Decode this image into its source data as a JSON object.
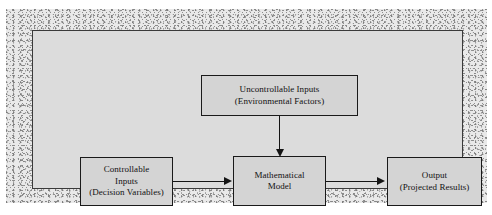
{
  "diagram": {
    "type": "flow-diagram",
    "background_color": "#dcdcdc",
    "node_fill_color": "#d4d4d4",
    "node_border_color": "#1a1a1a",
    "arrow_color": "#141414",
    "nodes": [
      {
        "id": "uncontrollable-inputs",
        "lines": [
          "Uncontrollable Inputs",
          "(Environmental Factors)"
        ],
        "line1": "Uncontrollable Inputs",
        "line2": "(Environmental Factors)"
      },
      {
        "id": "controllable-inputs",
        "lines": [
          "Controllable",
          "Inputs",
          "(Decision Variables)"
        ],
        "line1": "Controllable",
        "line2": "Inputs",
        "line3": "(Decision Variables)"
      },
      {
        "id": "mathematical-model",
        "lines": [
          "Mathematical",
          "Model"
        ],
        "line1": "Mathematical",
        "line2": "Model"
      },
      {
        "id": "output",
        "lines": [
          "Output",
          "(Projected Results)"
        ],
        "line1": "Output",
        "line2": "(Projected Results)"
      }
    ],
    "edges": [
      {
        "id": "uncontrollable-to-model",
        "from": "uncontrollable-inputs",
        "to": "mathematical-model",
        "direction": "down"
      },
      {
        "id": "controllable-to-model",
        "from": "controllable-inputs",
        "to": "mathematical-model",
        "direction": "right"
      },
      {
        "id": "model-to-output",
        "from": "mathematical-model",
        "to": "output",
        "direction": "right"
      }
    ]
  }
}
